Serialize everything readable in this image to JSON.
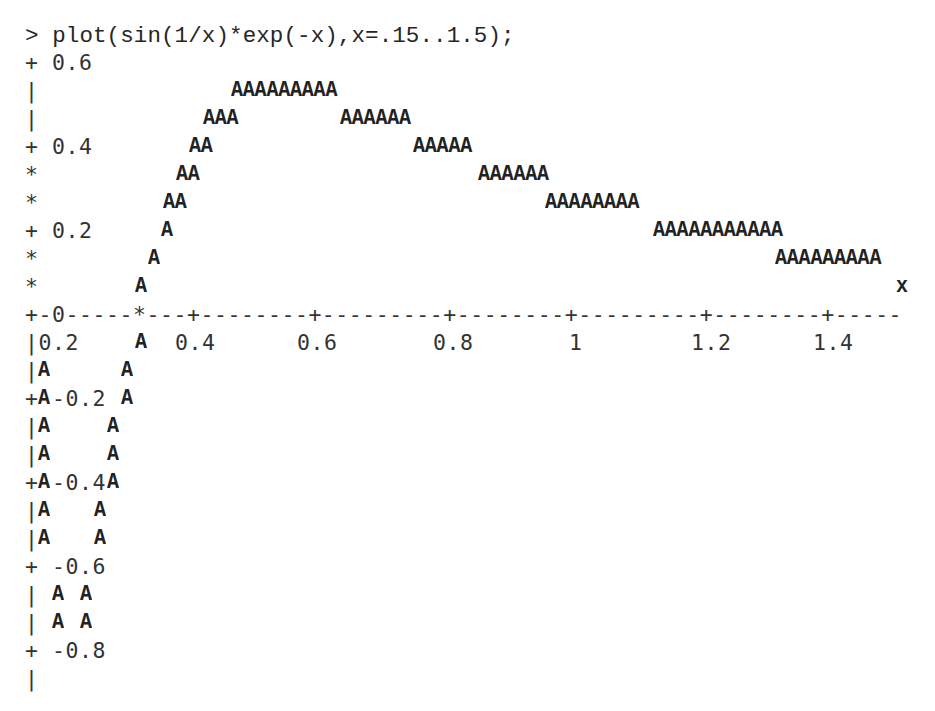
{
  "document": {
    "command_prompt": ">",
    "command": "plot(sin(1/x)*exp(-x),x=.15..1.5);"
  },
  "plot_rows": [
    {
      "y": 22,
      "segments": [
        {
          "x": 25,
          "text": "> plot(sin(1/x)*exp(-x),x=.15..1.5);",
          "kind": "prompt"
        }
      ]
    },
    {
      "y": 49,
      "segments": [
        {
          "x": 25,
          "text": "+ 0.6",
          "kind": "txt"
        }
      ]
    },
    {
      "y": 77,
      "segments": [
        {
          "x": 25,
          "text": "|",
          "kind": "txt"
        },
        {
          "x": 231,
          "text": "AAAAAAAAA",
          "kind": "mark"
        }
      ]
    },
    {
      "y": 105,
      "segments": [
        {
          "x": 25,
          "text": "|",
          "kind": "txt"
        },
        {
          "x": 203,
          "text": "AAA",
          "kind": "mark"
        },
        {
          "x": 340,
          "text": "AAAAAA",
          "kind": "mark"
        }
      ]
    },
    {
      "y": 133,
      "segments": [
        {
          "x": 25,
          "text": "+ 0.4",
          "kind": "txt"
        },
        {
          "x": 189,
          "text": "AA",
          "kind": "mark"
        },
        {
          "x": 413,
          "text": "AAAAA",
          "kind": "mark"
        }
      ]
    },
    {
      "y": 161,
      "segments": [
        {
          "x": 25,
          "text": "*",
          "kind": "txt"
        },
        {
          "x": 176,
          "text": "AA",
          "kind": "mark"
        },
        {
          "x": 478,
          "text": "AAAAAA",
          "kind": "mark"
        }
      ]
    },
    {
      "y": 189,
      "segments": [
        {
          "x": 25,
          "text": "*",
          "kind": "txt"
        },
        {
          "x": 163,
          "text": "AA",
          "kind": "mark"
        },
        {
          "x": 545,
          "text": "AAAAAAAA",
          "kind": "mark"
        }
      ]
    },
    {
      "y": 217,
      "segments": [
        {
          "x": 25,
          "text": "+ 0.2",
          "kind": "txt"
        },
        {
          "x": 161,
          "text": "A",
          "kind": "mark"
        },
        {
          "x": 653,
          "text": "AAAAAAAAAAA",
          "kind": "mark"
        }
      ]
    },
    {
      "y": 245,
      "segments": [
        {
          "x": 25,
          "text": "*",
          "kind": "txt"
        },
        {
          "x": 148,
          "text": "A",
          "kind": "mark"
        },
        {
          "x": 775,
          "text": "AAAAAAAAA",
          "kind": "mark"
        }
      ]
    },
    {
      "y": 273,
      "segments": [
        {
          "x": 25,
          "text": "*",
          "kind": "txt"
        },
        {
          "x": 135,
          "text": "A",
          "kind": "mark"
        },
        {
          "x": 896,
          "text": "x",
          "kind": "mark"
        }
      ]
    },
    {
      "y": 301,
      "segments": [
        {
          "x": 25,
          "text": "+-0-----*---+--------+---------+--------+---------+--------+-----",
          "kind": "axis"
        }
      ]
    },
    {
      "y": 329,
      "segments": [
        {
          "x": 25,
          "text": "|0.2",
          "kind": "txt"
        },
        {
          "x": 135,
          "text": "A",
          "kind": "mark"
        },
        {
          "x": 175,
          "text": "0.4",
          "kind": "txt"
        },
        {
          "x": 297,
          "text": "0.6",
          "kind": "txt"
        },
        {
          "x": 433,
          "text": "0.8",
          "kind": "txt"
        },
        {
          "x": 569,
          "text": "1",
          "kind": "txt"
        },
        {
          "x": 691,
          "text": "1.2",
          "kind": "txt"
        },
        {
          "x": 813,
          "text": "1.4",
          "kind": "txt"
        }
      ]
    },
    {
      "y": 357,
      "segments": [
        {
          "x": 25,
          "text": "|",
          "kind": "txt"
        },
        {
          "x": 38,
          "text": "A",
          "kind": "mark"
        },
        {
          "x": 121,
          "text": "A",
          "kind": "mark"
        }
      ]
    },
    {
      "y": 385,
      "segments": [
        {
          "x": 25,
          "text": "+",
          "kind": "txt"
        },
        {
          "x": 38,
          "text": "A",
          "kind": "mark"
        },
        {
          "x": 52,
          "text": "-0.2",
          "kind": "txt"
        },
        {
          "x": 121,
          "text": "A",
          "kind": "mark"
        }
      ]
    },
    {
      "y": 413,
      "segments": [
        {
          "x": 25,
          "text": "|",
          "kind": "txt"
        },
        {
          "x": 38,
          "text": "A",
          "kind": "mark"
        },
        {
          "x": 107,
          "text": "A",
          "kind": "mark"
        }
      ]
    },
    {
      "y": 441,
      "segments": [
        {
          "x": 25,
          "text": "|",
          "kind": "txt"
        },
        {
          "x": 38,
          "text": "A",
          "kind": "mark"
        },
        {
          "x": 107,
          "text": "A",
          "kind": "mark"
        }
      ]
    },
    {
      "y": 469,
      "segments": [
        {
          "x": 25,
          "text": "+",
          "kind": "txt"
        },
        {
          "x": 38,
          "text": "A",
          "kind": "mark"
        },
        {
          "x": 52,
          "text": "-0.4",
          "kind": "txt"
        },
        {
          "x": 107,
          "text": "A",
          "kind": "mark"
        }
      ]
    },
    {
      "y": 497,
      "segments": [
        {
          "x": 25,
          "text": "|",
          "kind": "txt"
        },
        {
          "x": 38,
          "text": "A",
          "kind": "mark"
        },
        {
          "x": 94,
          "text": "A",
          "kind": "mark"
        }
      ]
    },
    {
      "y": 525,
      "segments": [
        {
          "x": 25,
          "text": "|",
          "kind": "txt"
        },
        {
          "x": 38,
          "text": "A",
          "kind": "mark"
        },
        {
          "x": 94,
          "text": "A",
          "kind": "mark"
        }
      ]
    },
    {
      "y": 553,
      "segments": [
        {
          "x": 25,
          "text": "+ -0.6",
          "kind": "txt"
        }
      ]
    },
    {
      "y": 581,
      "segments": [
        {
          "x": 25,
          "text": "|",
          "kind": "txt"
        },
        {
          "x": 52,
          "text": "A",
          "kind": "mark"
        },
        {
          "x": 80,
          "text": "A",
          "kind": "mark"
        }
      ]
    },
    {
      "y": 609,
      "segments": [
        {
          "x": 25,
          "text": "|",
          "kind": "txt"
        },
        {
          "x": 52,
          "text": "A",
          "kind": "mark"
        },
        {
          "x": 80,
          "text": "A",
          "kind": "mark"
        }
      ]
    },
    {
      "y": 637,
      "segments": [
        {
          "x": 25,
          "text": "+ -0.8",
          "kind": "txt"
        }
      ]
    },
    {
      "y": 665,
      "segments": [
        {
          "x": 25,
          "text": "|",
          "kind": "txt"
        }
      ]
    }
  ],
  "chart_data": {
    "type": "line",
    "title": "plot(sin(1/x)*exp(-x),x=.15..1.5)",
    "render_style": "ascii character plot, marker 'A'",
    "function": "sin(1/x)*exp(-x)",
    "xlabel": "x",
    "ylabel": "",
    "xlim": [
      0.15,
      1.5
    ],
    "ylim": [
      -0.8,
      0.6
    ],
    "x_ticks": [
      "0",
      "0.2",
      "0.4",
      "0.6",
      "0.8",
      "1",
      "1.2",
      "1.4"
    ],
    "y_ticks": [
      "0.6",
      "0.4",
      "0.2",
      "0",
      "-0.2",
      "-0.4",
      "-0.6",
      "-0.8"
    ],
    "grid": false,
    "legend": null,
    "x": [
      0.15,
      0.2,
      0.25,
      0.3,
      0.35,
      0.4,
      0.5,
      0.6,
      0.7,
      0.8,
      0.9,
      1.0,
      1.1,
      1.2,
      1.3,
      1.4,
      1.5
    ],
    "values": [
      0.32,
      -0.79,
      -0.59,
      -0.14,
      0.2,
      0.4,
      0.55,
      0.55,
      0.49,
      0.43,
      0.36,
      0.31,
      0.26,
      0.22,
      0.19,
      0.16,
      0.14
    ]
  }
}
